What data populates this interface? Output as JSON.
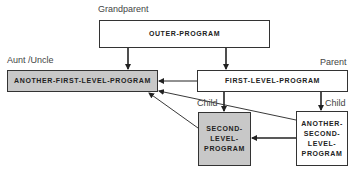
{
  "diagram": {
    "boxes": {
      "outer": {
        "text": "OUTER-PROGRAM",
        "role": "Grandparent"
      },
      "aunt": {
        "text": "ANOTHER-FIRST-LEVEL-PROGRAM",
        "role": "Aunt /Uncle"
      },
      "first": {
        "text": "FIRST-LEVEL-PROGRAM",
        "role": "Parent"
      },
      "second": {
        "text": "SECOND-\nLEVEL-\nPROGRAM",
        "role": "Child"
      },
      "another_second": {
        "text": "ANOTHER-\nSECOND-\nLEVEL-\nPROGRAM",
        "role": "Child"
      }
    },
    "colors": {
      "highlight_fill": "#c8c8c8",
      "line": "#222222"
    },
    "edges": [
      {
        "from": "OUTER-PROGRAM",
        "to": "ANOTHER-FIRST-LEVEL-PROGRAM"
      },
      {
        "from": "OUTER-PROGRAM",
        "to": "FIRST-LEVEL-PROGRAM"
      },
      {
        "from": "FIRST-LEVEL-PROGRAM",
        "to": "ANOTHER-FIRST-LEVEL-PROGRAM"
      },
      {
        "from": "FIRST-LEVEL-PROGRAM",
        "to": "SECOND-LEVEL-PROGRAM"
      },
      {
        "from": "FIRST-LEVEL-PROGRAM",
        "to": "ANOTHER-SECOND-LEVEL-PROGRAM"
      },
      {
        "from": "SECOND-LEVEL-PROGRAM",
        "to": "ANOTHER-FIRST-LEVEL-PROGRAM"
      },
      {
        "from": "ANOTHER-SECOND-LEVEL-PROGRAM",
        "to": "ANOTHER-FIRST-LEVEL-PROGRAM"
      },
      {
        "from": "ANOTHER-SECOND-LEVEL-PROGRAM",
        "to": "SECOND-LEVEL-PROGRAM"
      }
    ]
  }
}
